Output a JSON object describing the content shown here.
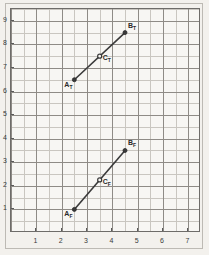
{
  "chart_data": {
    "type": "line",
    "title": "",
    "xlabel": "",
    "ylabel": "",
    "xlim": [
      0,
      7.5
    ],
    "ylim": [
      0,
      9.5
    ],
    "grid": true,
    "grid_minor_step": 0.5,
    "legend": "none",
    "xticks": [
      1,
      2,
      3,
      4,
      5,
      6,
      7
    ],
    "yticks": [
      1,
      2,
      3,
      4,
      5,
      6,
      7,
      8,
      9
    ],
    "xtick_labels": [
      "1",
      "2",
      "3",
      "4",
      "5",
      "6",
      "7"
    ],
    "ytick_labels": [
      "1",
      "2",
      "3",
      "4",
      "5",
      "6",
      "7",
      "8",
      "9"
    ],
    "series": [
      {
        "name": "T",
        "points": [
          {
            "label": "A",
            "sub": "T",
            "x": 2.5,
            "y": 6.5,
            "marker": "filled"
          },
          {
            "label": "C",
            "sub": "T",
            "x": 3.5,
            "y": 7.5,
            "marker": "open"
          },
          {
            "label": "B",
            "sub": "T",
            "x": 4.5,
            "y": 8.5,
            "marker": "filled"
          }
        ]
      },
      {
        "name": "F",
        "points": [
          {
            "label": "A",
            "sub": "F",
            "x": 2.5,
            "y": 1.0,
            "marker": "filled"
          },
          {
            "label": "C",
            "sub": "F",
            "x": 3.5,
            "y": 2.25,
            "marker": "open"
          },
          {
            "label": "B",
            "sub": "F",
            "x": 4.5,
            "y": 3.5,
            "marker": "filled"
          }
        ]
      }
    ]
  },
  "style": {
    "background": "#f3f1ed",
    "plot_background": "#f7f6f3",
    "grid_minor_color": "#c9c6c0",
    "grid_major_color": "#8e8b86",
    "frame_color": "#6e6c69",
    "line_color": "#3a3a3a",
    "text_color": "#2b2b2b"
  }
}
